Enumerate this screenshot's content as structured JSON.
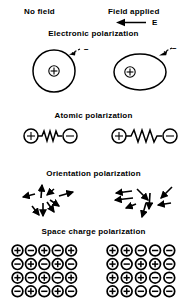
{
  "figure": {
    "width": 187,
    "height": 302,
    "background": "#ffffff",
    "ink": "#000000"
  },
  "columns": {
    "left_header": "No field",
    "right_header": "Field applied",
    "field_symbol": "E",
    "field_arrow_direction": "left"
  },
  "sections": [
    {
      "id": "electronic",
      "title": "Electronic polarization",
      "left_caption": "−",
      "right_caption": "−",
      "left_shape": "circle",
      "right_shape": "ellipse",
      "nucleus_symbol": "+"
    },
    {
      "id": "atomic",
      "title": "Atomic polarization",
      "left_positive": "+",
      "left_negative": "−",
      "right_positive": "+",
      "right_negative": "−",
      "left_spring_coils": 4,
      "right_spring_coils": 5
    },
    {
      "id": "orientation",
      "title": "Orientation polarization",
      "left_arrows_deg": [
        160,
        90,
        225,
        270,
        20,
        200,
        135,
        315
      ],
      "right_arrows_deg": [
        180,
        170,
        300,
        265,
        55,
        190,
        200,
        75
      ]
    },
    {
      "id": "space_charge",
      "title": "Space charge polarization",
      "left_grid": [
        [
          "+",
          "−",
          "+",
          "−",
          "+"
        ],
        [
          "−",
          "+",
          "−",
          "+",
          "−"
        ],
        [
          "+",
          "−",
          "+",
          "−",
          "+"
        ],
        [
          "−",
          "+",
          "−",
          "+",
          "−"
        ]
      ],
      "right_grid": [
        [
          "+",
          "+",
          "−",
          "−",
          "−"
        ],
        [
          "+",
          "−",
          "+",
          "+",
          "−"
        ],
        [
          "+",
          "+",
          "+",
          "−",
          "−"
        ],
        [
          "+",
          "+",
          "−",
          "−",
          "−"
        ]
      ]
    }
  ]
}
